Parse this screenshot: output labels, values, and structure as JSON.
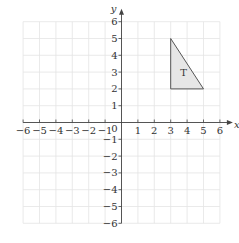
{
  "diagram": {
    "type": "coordinate-grid",
    "x_axis": {
      "label": "x",
      "min": -6,
      "max": 6,
      "ticks": [
        "-6",
        "-5",
        "-4",
        "-3",
        "-2",
        "-1",
        "1",
        "2",
        "3",
        "4",
        "5",
        "6"
      ]
    },
    "y_axis": {
      "label": "y",
      "min": -6,
      "max": 6,
      "ticks": [
        "6",
        "5",
        "4",
        "3",
        "2",
        "1",
        "-1",
        "-2",
        "-3",
        "-4",
        "-5",
        "-6"
      ]
    },
    "origin_label": "0",
    "shapes": [
      {
        "name": "T",
        "label": "T",
        "vertices": [
          [
            3,
            5
          ],
          [
            3,
            2
          ],
          [
            5,
            2
          ]
        ],
        "fill": "#e6e6e6",
        "stroke": "#555555"
      }
    ],
    "colors": {
      "grid": "#e4e4e4",
      "axis": "#444444",
      "text": "#333333"
    }
  }
}
